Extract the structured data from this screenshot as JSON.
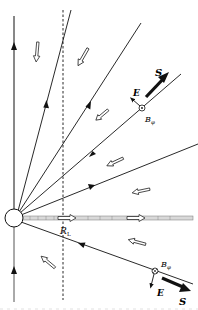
{
  "diagram": {
    "title": "",
    "labels": {
      "S_upper": "S",
      "E_upper": "E",
      "B_upper": "B",
      "B_upper_sub": "φ",
      "RL": "R",
      "RL_sub": "L",
      "B_lower": "B",
      "B_lower_sub": "φ",
      "E_lower": "E",
      "S_lower": "S"
    },
    "elements": {
      "star": "neutron-star",
      "light_cylinder": "light-cylinder-dashed-line",
      "current_sheet": "equatorial-current-sheet",
      "field_lines_count_upper": 4,
      "field_lines_count_lower": 1
    },
    "colors": {
      "line": "#111111",
      "sheet_fill": "#d9d9d9",
      "hollow_arrow_fill": "#ffffff"
    }
  }
}
